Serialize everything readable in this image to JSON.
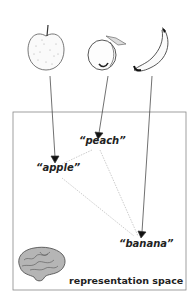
{
  "diagram": {
    "objects": [
      {
        "name": "apple",
        "icon": "apple-sketch"
      },
      {
        "name": "peach",
        "icon": "peach-sketch"
      },
      {
        "name": "banana",
        "icon": "banana-sketch"
      }
    ],
    "labels": {
      "apple": "“apple”",
      "peach": "“peach”",
      "banana": "“banana”"
    },
    "caption": "representation space",
    "caption_icon": "brain-icon",
    "colors": {
      "line": "#333333",
      "dotted": "#aaaaaa",
      "box": "#888888"
    }
  }
}
